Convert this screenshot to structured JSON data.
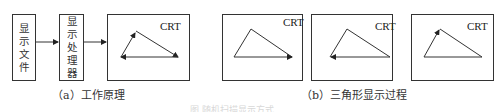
{
  "panel_a": {
    "file_box": {
      "label_chars": [
        "显",
        "示",
        "文",
        "件"
      ]
    },
    "processor_box": {
      "label_chars": [
        "显",
        "示",
        "处",
        "理",
        "器"
      ]
    },
    "screen_label": "CRT",
    "caption": "（a）工作原理"
  },
  "panel_b": {
    "screens": [
      {
        "label": "CRT",
        "step": "first two edges drawn, arrow on base"
      },
      {
        "label": "CRT",
        "step": "base drawn leftward"
      },
      {
        "label": "CRT",
        "step": "third edge drawn upward"
      }
    ],
    "caption": "（b）三角形显示过程"
  },
  "figure_caption": "图    随机扫描显示方式"
}
